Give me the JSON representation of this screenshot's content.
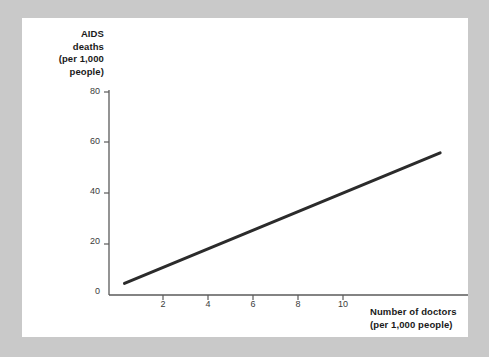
{
  "page": {
    "background_color": "#c9c9c9",
    "card_color": "#ffffff"
  },
  "chart_data": {
    "type": "line",
    "title": "",
    "subtitle": "",
    "ylabel": "AIDS deaths (per 1,000 people)",
    "ylabel_lines": [
      "AIDS",
      "deaths",
      "(per 1,000",
      "people)"
    ],
    "xlabel": "Number of doctors (per 1,000 people)",
    "xlabel_lines": [
      "Number of doctors",
      "(per 1,000 people)"
    ],
    "xlim": [
      0,
      11.6
    ],
    "ylim": [
      0,
      88
    ],
    "xticks": [
      2,
      4,
      6,
      8,
      10
    ],
    "xtick_labels": [
      "2",
      "4",
      "6",
      "8",
      "10"
    ],
    "yticks": [
      0,
      20,
      40,
      60,
      80
    ],
    "ytick_labels": [
      "0",
      "20",
      "40",
      "60",
      "80"
    ],
    "grid": false,
    "legend": false,
    "legend_position": "none",
    "line_color": "#2b2b2b",
    "line_width": 3,
    "series": [
      {
        "name": "AIDS deaths vs doctors",
        "x": [
          0.5,
          10.7
        ],
        "y": [
          5,
          61
        ]
      }
    ],
    "annotations": []
  }
}
